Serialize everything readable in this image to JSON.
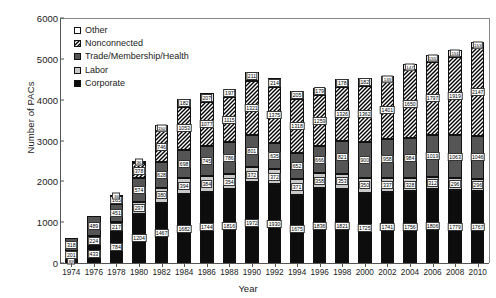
{
  "chart_data": {
    "type": "bar",
    "subtype": "stacked-bar",
    "title": "",
    "xlabel": "Year",
    "ylabel": "Number of PACs",
    "ylim": [
      0,
      6000
    ],
    "yticks": [
      0,
      1000,
      2000,
      3000,
      4000,
      5000,
      6000
    ],
    "grid": false,
    "legend_position": "upper-left-inside",
    "categories": [
      "1974",
      "1976",
      "1978",
      "1980",
      "1982",
      "1984",
      "1986",
      "1988",
      "1990",
      "1992",
      "1994",
      "1996",
      "1998",
      "2000",
      "2002",
      "2004",
      "2006",
      "2008",
      "2010"
    ],
    "series": [
      {
        "name": "Corporate",
        "color": "#0d0d0d",
        "pattern": "solid-black",
        "values": [
          89,
          433,
          784,
          1204,
          1467,
          1682,
          1744,
          1816,
          1972,
          1930,
          1675,
          1836,
          1821,
          1725,
          1741,
          1756,
          1806,
          1779,
          1767
        ]
      },
      {
        "name": "Labor",
        "color": "#c9c9c9",
        "pattern": "light-gray",
        "values": [
          201,
          224,
          217,
          297,
          380,
          394,
          384,
          354,
          372,
          372,
          371,
          358,
          353,
          350,
          337,
          328,
          312,
          296,
          296
        ]
      },
      {
        "name": "Trade/Membership/Health",
        "color": "#555555",
        "pattern": "dark-gray",
        "values": [
          318,
          489,
          451,
          574,
          628,
          698,
          745,
          786,
          801,
          635,
          652,
          666,
          821,
          900,
          958,
          984,
          1019,
          1063,
          1046
        ]
      },
      {
        "name": "Nonconnected",
        "color": "#4a4a4a",
        "pattern": "diagonal-hatch",
        "values": [
          0,
          0,
          165,
          378,
          746,
          1053,
          1077,
          1115,
          1321,
          1375,
          1318,
          1259,
          1326,
          1362,
          1401,
          1650,
          1797,
          1919,
          2147
        ]
      },
      {
        "name": "Other",
        "color": "#ffffff",
        "pattern": "white",
        "values": [
          0,
          0,
          36,
          36,
          150,
          182,
          207,
          197,
          211,
          214,
          205,
          179,
          178,
          182,
          133,
          147,
          155,
          151,
          153
        ]
      }
    ]
  },
  "legend": {
    "items": [
      {
        "label": "Other",
        "swatch": "sw-other"
      },
      {
        "label": "Nonconnected",
        "swatch": "sw-hatch"
      },
      {
        "label": "Trade/Membership/Health",
        "swatch": "sw-trade"
      },
      {
        "label": "Labor",
        "swatch": "sw-labor"
      },
      {
        "label": "Corporate",
        "swatch": "sw-corp"
      }
    ]
  }
}
